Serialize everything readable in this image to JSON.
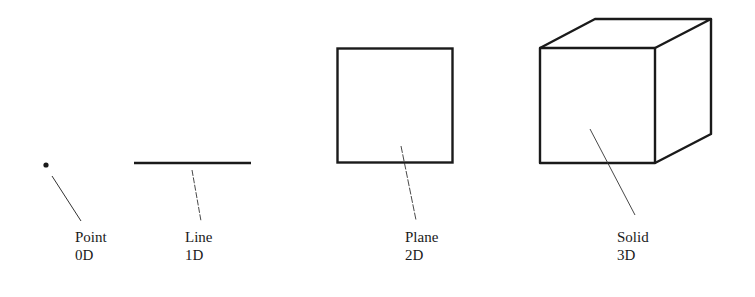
{
  "figure": {
    "colors": {
      "stroke": "#1a1a1a",
      "leader": "#333333",
      "background": "#ffffff"
    },
    "items": [
      {
        "id": "point",
        "shape": "point",
        "name": "Point",
        "dimension": "0D"
      },
      {
        "id": "line",
        "shape": "line-segment",
        "name": "Line",
        "dimension": "1D"
      },
      {
        "id": "plane",
        "shape": "square",
        "name": "Plane",
        "dimension": "2D"
      },
      {
        "id": "solid",
        "shape": "cube",
        "name": "Solid",
        "dimension": "3D"
      }
    ]
  }
}
